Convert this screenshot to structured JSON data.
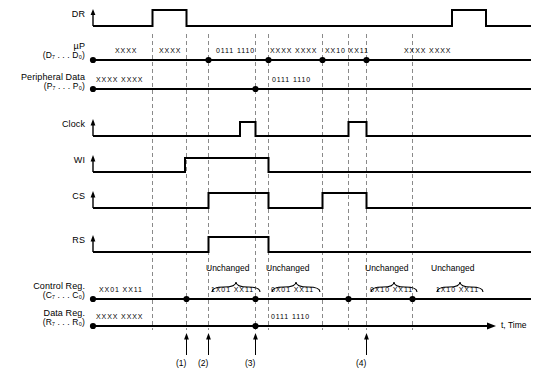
{
  "figure": {
    "type": "timing-diagram",
    "time_axis_label": "t, Time"
  },
  "rows": [
    {
      "id": "dr",
      "name": "DR",
      "sub": "",
      "kind": "logic"
    },
    {
      "id": "up",
      "name": "µP",
      "sub": "(D₇ . . . D₀)",
      "kind": "bus"
    },
    {
      "id": "periph",
      "name": "Peripheral Data",
      "sub": "(P₇ . . . P₀)",
      "kind": "bus"
    },
    {
      "id": "clock",
      "name": "Clock",
      "sub": "",
      "kind": "logic"
    },
    {
      "id": "wi",
      "name": "WI",
      "sub": "",
      "kind": "logic"
    },
    {
      "id": "cs",
      "name": "CS",
      "sub": "",
      "kind": "logic"
    },
    {
      "id": "rs",
      "name": "RS",
      "sub": "",
      "kind": "logic"
    },
    {
      "id": "creg",
      "name": "Control Reg.",
      "sub": "(C₇ . . . C₀)",
      "kind": "bus"
    },
    {
      "id": "dreg",
      "name": "Data Reg.",
      "sub": "(R₇ . . . R₀)",
      "kind": "bus"
    }
  ],
  "bus_values": {
    "up": [
      "XXXX",
      "XXXX",
      "0111 1110",
      "XXXX XXXX",
      "XX10 XX11",
      "XXXX XXXX"
    ],
    "periph": [
      "XXXX XXXX",
      "0111 1110"
    ],
    "control_reg": [
      "XX01 XX11",
      "1X01 XX11",
      "0X01 XX11",
      "0X10 XX11",
      "1X10 XX11"
    ],
    "data_reg": [
      "XXXX XXXX",
      "0111 1110"
    ]
  },
  "unchanged_labels": [
    "Unchanged",
    "Unchanged",
    "Unchanged",
    "Unchanged"
  ],
  "event_markers": [
    "(1)",
    "(2)",
    "(3)",
    "(4)"
  ],
  "colors": {
    "trace": "#000000",
    "dashed": "#8a8a8a",
    "background": "#ffffff"
  }
}
